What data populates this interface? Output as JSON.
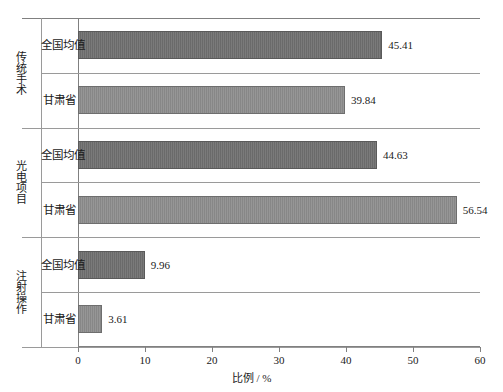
{
  "chart_data": {
    "type": "bar",
    "orientation": "horizontal",
    "title": "",
    "xlabel": "比例 / %",
    "ylabel": "",
    "xlim": [
      0,
      60
    ],
    "xticks": [
      0,
      10,
      20,
      30,
      40,
      50,
      60
    ],
    "xtick_labels": [
      "0",
      "10",
      "20",
      "30",
      "40",
      "50",
      "60"
    ],
    "grid": false,
    "legend": "none",
    "groups": [
      {
        "group_label": "传统手术",
        "rows": [
          {
            "label": "全国均值",
            "value": 45.41,
            "value_label": "45.41",
            "shade": "dark"
          },
          {
            "label": "甘肃省",
            "value": 39.84,
            "value_label": "39.84",
            "shade": "light"
          }
        ]
      },
      {
        "group_label": "光电项目",
        "rows": [
          {
            "label": "全国均值",
            "value": 44.63,
            "value_label": "44.63",
            "shade": "dark"
          },
          {
            "label": "甘肃省",
            "value": 56.54,
            "value_label": "56.54",
            "shade": "light"
          }
        ]
      },
      {
        "group_label": "注射操作",
        "rows": [
          {
            "label": "全国均值",
            "value": 9.96,
            "value_label": "9.96",
            "shade": "dark"
          },
          {
            "label": "甘肃省",
            "value": 3.61,
            "value_label": "3.61",
            "shade": "light"
          }
        ]
      }
    ],
    "categories": [
      "传统手术 - 全国均值",
      "传统手术 - 甘肃省",
      "光电项目 - 全国均值",
      "光电项目 - 甘肃省",
      "注射操作 - 全国均值",
      "注射操作 - 甘肃省"
    ],
    "values": [
      45.41,
      39.84,
      44.63,
      56.54,
      9.96,
      3.61
    ],
    "colors": {
      "bar_dark": "#707070",
      "bar_light": "#8e8e8e",
      "axis": "#808080"
    }
  },
  "caption": ""
}
